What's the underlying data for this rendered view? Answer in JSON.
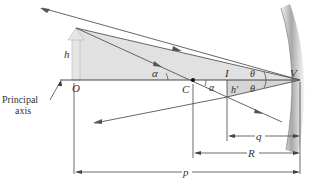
{
  "diagram": {
    "type": "concave-mirror-ray-diagram",
    "labels": {
      "object_point": "O",
      "center": "C",
      "image_point": "I",
      "vertex": "V",
      "object_height": "h",
      "image_height": "h′",
      "angle_alpha": "α",
      "angle_theta": "θ",
      "image_distance": "q",
      "radius": "R",
      "object_distance": "p",
      "principal_axis_line1": "Principal",
      "principal_axis_line2": "axis"
    },
    "colors": {
      "ray": "#555555",
      "fill": "#d9d9d9",
      "object_arrow": "#e4e4e4",
      "axis": "#333333"
    }
  }
}
